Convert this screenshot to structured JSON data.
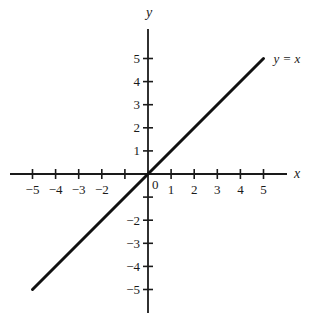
{
  "chart_data": {
    "type": "line",
    "title": "",
    "xlabel": "x",
    "ylabel": "y",
    "xlim": [
      -5,
      5
    ],
    "ylim": [
      -5,
      5
    ],
    "grid": false,
    "x_ticks": [
      -5,
      -4,
      -3,
      -2,
      -1,
      0,
      1,
      2,
      3,
      4,
      5
    ],
    "y_ticks": [
      -5,
      -4,
      -3,
      -2,
      -1,
      0,
      1,
      2,
      3,
      4,
      5
    ],
    "x_tick_labels": [
      "−5",
      "−4",
      "−3",
      "−2",
      "",
      "0",
      "1",
      "2",
      "3",
      "4",
      "5"
    ],
    "y_tick_labels": [
      "−5",
      "−4",
      "−3",
      "−2",
      "",
      "",
      "1",
      "2",
      "3",
      "4",
      "5"
    ],
    "origin_label": "0",
    "series": [
      {
        "name": "y = x",
        "x": [
          -5,
          5
        ],
        "y": [
          -5,
          5
        ],
        "color": "#111111"
      }
    ],
    "annotations": [
      {
        "text": "y = x",
        "x": 5,
        "y": 5,
        "position": "right"
      }
    ]
  },
  "layout": {
    "origin_px": [
      148,
      174
    ],
    "unit_px": 23.1,
    "x_axis_px": [
      10,
      287
    ],
    "y_axis_px": [
      29,
      313
    ],
    "axis_color": "#1a1a1a",
    "line_color": "#111111"
  }
}
